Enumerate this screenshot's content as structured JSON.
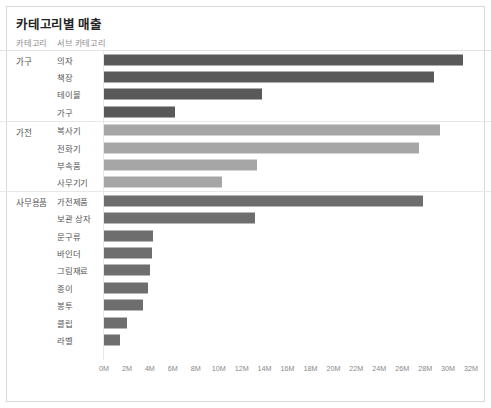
{
  "chart": {
    "title": "카테고리별 매출",
    "columns": {
      "category": "카테고리",
      "subcategory": "서브 카테고리"
    }
  },
  "chart_data": {
    "type": "bar",
    "orientation": "horizontal",
    "title": "카테고리별 매출",
    "xlabel": "",
    "ylabel": "",
    "xlim": [
      0,
      32
    ],
    "unit": "M",
    "grid": false,
    "legend": "none",
    "axis_ticks": [
      "0M",
      "2M",
      "4M",
      "6M",
      "8M",
      "10M",
      "12M",
      "14M",
      "16M",
      "18M",
      "20M",
      "22M",
      "24M",
      "26M",
      "28M",
      "30M",
      "32M"
    ],
    "axis_tick_values": [
      0,
      2,
      4,
      6,
      8,
      10,
      12,
      14,
      16,
      18,
      20,
      22,
      24,
      26,
      28,
      30,
      32
    ],
    "groups": [
      {
        "label": "가구",
        "color": "#595959",
        "items": [
          {
            "label": "의자",
            "value": 31.3
          },
          {
            "label": "책장",
            "value": 28.8
          },
          {
            "label": "테이블",
            "value": 13.8
          },
          {
            "label": "가구",
            "value": 6.2
          }
        ]
      },
      {
        "label": "가전",
        "color": "#a6a6a6",
        "items": [
          {
            "label": "복사기",
            "value": 29.3
          },
          {
            "label": "전화기",
            "value": 27.5
          },
          {
            "label": "부속품",
            "value": 13.3
          },
          {
            "label": "사무기기",
            "value": 10.3
          }
        ]
      },
      {
        "label": "사무용품",
        "color": "#6e6e6e",
        "items": [
          {
            "label": "가전제품",
            "value": 27.8
          },
          {
            "label": "보관 상자",
            "value": 13.2
          },
          {
            "label": "문구류",
            "value": 4.3
          },
          {
            "label": "바인더",
            "value": 4.2
          },
          {
            "label": "그림재료",
            "value": 4.0
          },
          {
            "label": "종이",
            "value": 3.8
          },
          {
            "label": "봉투",
            "value": 3.4
          },
          {
            "label": "클립",
            "value": 2.0
          },
          {
            "label": "라벨",
            "value": 1.4
          }
        ]
      }
    ]
  }
}
